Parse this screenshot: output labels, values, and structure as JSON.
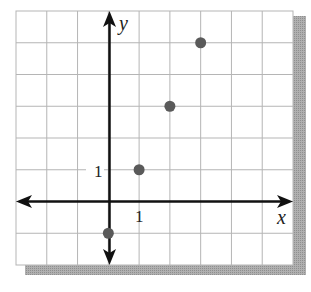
{
  "chart_data": {
    "type": "scatter",
    "title": "",
    "xlabel": "x",
    "ylabel": "y",
    "xlim": [
      -3,
      6
    ],
    "ylim": [
      -2,
      6
    ],
    "grid": true,
    "tick_labels": {
      "x": [
        "1"
      ],
      "y": [
        "1"
      ]
    },
    "series": [
      {
        "name": "points",
        "x": [
          0,
          1,
          2,
          3
        ],
        "y": [
          -1,
          1,
          3,
          5
        ]
      }
    ],
    "colors": {
      "point": "#5a5a5a",
      "grid": "#b5b5b5",
      "axis": "#111111",
      "shadow": "#a8a8a8"
    }
  }
}
